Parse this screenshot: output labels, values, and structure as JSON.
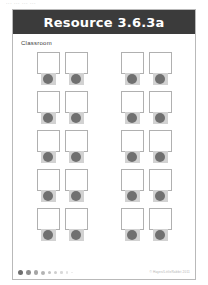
{
  "scan": {
    "top_bleed_text": "··· ··· ··· ···"
  },
  "page": {
    "header": {
      "title": "Resource 3.6.3a",
      "background_color": "#3b3b3b",
      "text_color": "#ffffff"
    },
    "section_label": "Classroom",
    "border_color": "#b9b9b9",
    "background_color": "#ffffff"
  },
  "seating": {
    "rows": 5,
    "groups_per_row": 2,
    "desks_per_group": 2,
    "total_desks": 20,
    "desk_color": "#ffffff",
    "desk_border_color": "#b0b0b0",
    "seat_color": "#d2d2d2",
    "seat_circle_color": "#707070",
    "layout": [
      [
        [
          {
            "desk": "desk",
            "seat": "chair"
          },
          {
            "desk": "desk",
            "seat": "chair"
          }
        ],
        [
          {
            "desk": "desk",
            "seat": "chair"
          },
          {
            "desk": "desk",
            "seat": "chair"
          }
        ]
      ],
      [
        [
          {
            "desk": "desk",
            "seat": "chair"
          },
          {
            "desk": "desk",
            "seat": "chair"
          }
        ],
        [
          {
            "desk": "desk",
            "seat": "chair"
          },
          {
            "desk": "desk",
            "seat": "chair"
          }
        ]
      ],
      [
        [
          {
            "desk": "desk",
            "seat": "chair"
          },
          {
            "desk": "desk",
            "seat": "chair"
          }
        ],
        [
          {
            "desk": "desk",
            "seat": "chair"
          },
          {
            "desk": "desk",
            "seat": "chair"
          }
        ]
      ],
      [
        [
          {
            "desk": "desk",
            "seat": "chair"
          },
          {
            "desk": "desk",
            "seat": "chair"
          }
        ],
        [
          {
            "desk": "desk",
            "seat": "chair"
          },
          {
            "desk": "desk",
            "seat": "chair"
          }
        ]
      ],
      [
        [
          {
            "desk": "desk",
            "seat": "chair"
          },
          {
            "desk": "desk",
            "seat": "chair"
          }
        ],
        [
          {
            "desk": "desk",
            "seat": "chair"
          },
          {
            "desk": "desk",
            "seat": "chair"
          }
        ]
      ]
    ]
  },
  "footer": {
    "dots": [
      {
        "size": 5.0,
        "opacity": 1.0
      },
      {
        "size": 4.6,
        "opacity": 0.78
      },
      {
        "size": 4.2,
        "opacity": 0.62
      },
      {
        "size": 4.0,
        "opacity": 0.52
      },
      {
        "size": 3.6,
        "opacity": 0.42
      },
      {
        "size": 3.0,
        "opacity": 0.34
      },
      {
        "size": 2.6,
        "opacity": 0.26
      },
      {
        "size": 2.2,
        "opacity": 0.2
      },
      {
        "size": 1.8,
        "opacity": 0.14
      }
    ],
    "credit": "© Hayes/LittleRabbit 2011"
  }
}
